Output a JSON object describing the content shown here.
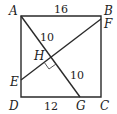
{
  "figure": {
    "type": "geometry",
    "points": {
      "A": {
        "label": "A",
        "x": 21,
        "y": 16
      },
      "B": {
        "label": "B",
        "x": 101,
        "y": 16
      },
      "C": {
        "label": "C",
        "x": 101,
        "y": 97
      },
      "D": {
        "label": "D",
        "x": 21,
        "y": 97
      },
      "E": {
        "label": "E",
        "x": 21,
        "y": 80
      },
      "F": {
        "label": "F",
        "x": 101,
        "y": 19
      },
      "G": {
        "label": "G",
        "x": 80,
        "y": 97
      },
      "H": {
        "label": "H",
        "x": 51,
        "y": 57
      }
    },
    "measurements": {
      "AB": "16",
      "AH": "10",
      "HG": "10",
      "DG": "12"
    },
    "right_angle_at": "H"
  }
}
